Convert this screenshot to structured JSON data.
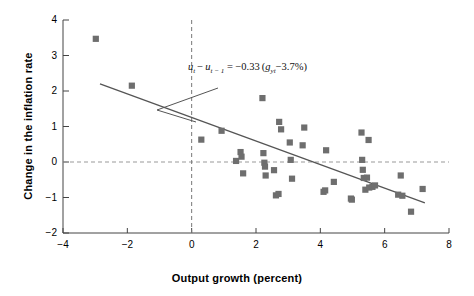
{
  "chart_data": {
    "type": "scatter",
    "title": "",
    "xlabel": "Output growth (percent)",
    "ylabel": "Change in the inflation rate",
    "xlim": [
      -4,
      8
    ],
    "ylim": [
      -2,
      4
    ],
    "xticks": [
      "-4",
      "-2",
      "0",
      "2",
      "4",
      "6",
      "8"
    ],
    "xtick_values": [
      -4,
      -2,
      0,
      2,
      4,
      6,
      8
    ],
    "yticks": [
      "4",
      "3",
      "2",
      "1",
      "0",
      "-1",
      "-2"
    ],
    "ytick_values": [
      4,
      3,
      2,
      1,
      0,
      -1,
      -2
    ],
    "grid": false,
    "legend": "none",
    "marker_color": "#6e6e6e",
    "line_color": "#555555",
    "reference_lines": [
      {
        "name": "zero-horizontal",
        "axis": "y",
        "value": 0,
        "style": "dashed"
      },
      {
        "name": "zero-vertical",
        "axis": "x",
        "value": 0,
        "style": "dashed"
      }
    ],
    "fit_line": {
      "name": "okun-regression-line",
      "equation_plain": "u_t - u_t-1 = -0.33 (g_yt - 3.7%)",
      "slope": -0.33,
      "intercept_x": 3.7,
      "x_start": -2.85,
      "y_start": 2.2,
      "x_end": 7.25,
      "y_end": -1.15
    },
    "annotation": {
      "lhs_var": "u",
      "sub_t": "t",
      "sub_t_minus_1": "t − 1",
      "coefficient": "−0.33",
      "growth_var": "g",
      "growth_sub": "yt",
      "constant": "3.7%",
      "text": "u_t − u_t−1 = −0.33 (g_yt − 3.7%)",
      "leader_from": [
        218,
        88
      ],
      "leader_to": [
        157,
        110
      ],
      "leader_to2": [
        196,
        122
      ]
    },
    "points": [
      {
        "x": -2.98,
        "y": 3.47
      },
      {
        "x": -1.86,
        "y": 2.15
      },
      {
        "x": 0.3,
        "y": 0.63
      },
      {
        "x": 0.93,
        "y": 0.88
      },
      {
        "x": 1.38,
        "y": 0.03
      },
      {
        "x": 1.52,
        "y": 0.28
      },
      {
        "x": 1.55,
        "y": 0.15
      },
      {
        "x": 1.6,
        "y": -0.32
      },
      {
        "x": 2.2,
        "y": 1.8
      },
      {
        "x": 2.23,
        "y": 0.25
      },
      {
        "x": 2.26,
        "y": -0.02
      },
      {
        "x": 2.28,
        "y": -0.13
      },
      {
        "x": 2.3,
        "y": -0.38
      },
      {
        "x": 2.56,
        "y": -0.23
      },
      {
        "x": 2.62,
        "y": -0.94
      },
      {
        "x": 2.7,
        "y": -0.9
      },
      {
        "x": 2.72,
        "y": 1.13
      },
      {
        "x": 2.78,
        "y": 0.92
      },
      {
        "x": 3.05,
        "y": 0.55
      },
      {
        "x": 3.08,
        "y": 0.06
      },
      {
        "x": 3.12,
        "y": -0.47
      },
      {
        "x": 3.45,
        "y": 0.47
      },
      {
        "x": 3.5,
        "y": 0.97
      },
      {
        "x": 4.1,
        "y": -0.84
      },
      {
        "x": 4.15,
        "y": -0.8
      },
      {
        "x": 4.18,
        "y": 0.33
      },
      {
        "x": 4.42,
        "y": -0.56
      },
      {
        "x": 4.95,
        "y": -1.03
      },
      {
        "x": 4.98,
        "y": -1.06
      },
      {
        "x": 5.28,
        "y": 0.83
      },
      {
        "x": 5.3,
        "y": 0.06
      },
      {
        "x": 5.32,
        "y": -0.22
      },
      {
        "x": 5.35,
        "y": -0.45
      },
      {
        "x": 5.4,
        "y": -0.78
      },
      {
        "x": 5.45,
        "y": -0.44
      },
      {
        "x": 5.5,
        "y": 0.62
      },
      {
        "x": 5.52,
        "y": -0.72
      },
      {
        "x": 5.62,
        "y": -0.7
      },
      {
        "x": 5.7,
        "y": -0.66
      },
      {
        "x": 6.42,
        "y": -0.92
      },
      {
        "x": 6.5,
        "y": -0.38
      },
      {
        "x": 6.55,
        "y": -0.95
      },
      {
        "x": 6.82,
        "y": -1.4
      },
      {
        "x": 7.18,
        "y": -0.76
      }
    ]
  },
  "axes": {
    "x_title": "Output growth (percent)",
    "y_title": "Change in the inflation rate"
  }
}
